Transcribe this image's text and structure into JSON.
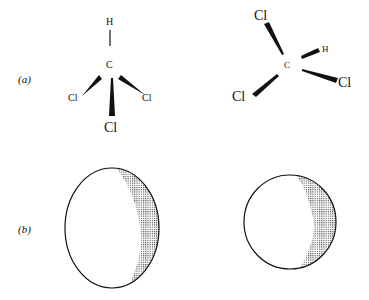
{
  "panels": {
    "a": {
      "label": "(a)",
      "left_molecule": {
        "center_atom": "C",
        "top_atom": "H",
        "left_atom": "Cl",
        "right_atom": "Cl",
        "bottom_atom": "Cl"
      },
      "right_molecule": {
        "center_atom": "C",
        "top_atom": "Cl",
        "h_atom": "H",
        "right_atom": "Cl",
        "bottom_left_atom": "Cl"
      }
    },
    "b": {
      "label": "(b)",
      "left_shape": "ellipse-shaded-crescent",
      "right_shape": "circle-shaded-crescent"
    }
  },
  "colors": {
    "ink": "#111111",
    "shade": "#555555"
  }
}
